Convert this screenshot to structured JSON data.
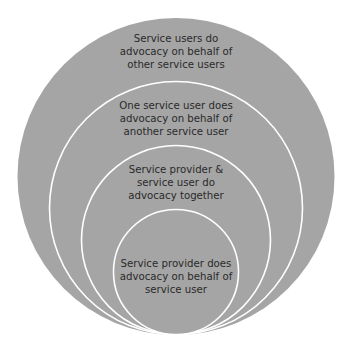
{
  "diagram": {
    "type": "nested-circles",
    "colors": {
      "fill": "#a5a5a5",
      "ring_stroke": "#ffffff",
      "text": "#2a2a2a",
      "background": "#ffffff"
    },
    "circles": [
      {
        "id": "outer",
        "lines": [
          "Service users do",
          "advocacy on behalf of",
          "other service users"
        ]
      },
      {
        "id": "second",
        "lines": [
          "One service user does",
          "advocacy on behalf of",
          "another service user"
        ]
      },
      {
        "id": "third",
        "lines": [
          "Service provider &",
          "service user do",
          "advocacy together"
        ]
      },
      {
        "id": "inner",
        "lines": [
          "Service provider does",
          "advocacy on behalf of",
          "service user"
        ]
      }
    ]
  }
}
